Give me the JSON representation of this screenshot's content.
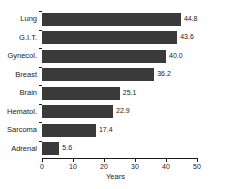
{
  "chart_data": {
    "type": "bar",
    "orientation": "horizontal",
    "title": "",
    "xlabel": "Years",
    "ylabel": "",
    "xlim": [
      0,
      50
    ],
    "xticks": [
      0,
      10,
      20,
      30,
      40,
      50
    ],
    "grid": false,
    "legend": false,
    "bar_color": "#3a3a3a",
    "background_color": "#ffffff",
    "categories": [
      "Lung",
      "G.I.T.",
      "Gynecol.",
      "Breast",
      "Brain",
      "Hematol.",
      "Sarcoma",
      "Adrenal"
    ],
    "values": [
      44.8,
      43.6,
      40.0,
      36.2,
      25.1,
      22.9,
      17.4,
      5.6
    ],
    "value_labels": [
      "44.8",
      "43.6",
      "40.0",
      "36.2",
      "25.1",
      "22.9",
      "17.4",
      "5.6"
    ],
    "tick_labels": [
      "0",
      "10",
      "20",
      "30",
      "40",
      "50"
    ]
  }
}
